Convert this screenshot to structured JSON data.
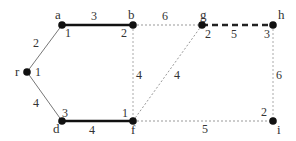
{
  "graph": {
    "nodes": [
      {
        "id": "r",
        "name": "r",
        "num": "1",
        "x": 27,
        "y": 72
      },
      {
        "id": "a",
        "name": "a",
        "num": "1",
        "x": 62,
        "y": 25
      },
      {
        "id": "b",
        "name": "b",
        "num": "2",
        "x": 133,
        "y": 25
      },
      {
        "id": "d",
        "name": "d",
        "num": "3",
        "x": 62,
        "y": 121
      },
      {
        "id": "f",
        "name": "f",
        "num": "1",
        "x": 133,
        "y": 121
      },
      {
        "id": "g",
        "name": "g",
        "num": "2",
        "x": 202,
        "y": 25
      },
      {
        "id": "h",
        "name": "h",
        "num": "3",
        "x": 273,
        "y": 25
      },
      {
        "id": "i",
        "name": "i",
        "num": "2",
        "x": 273,
        "y": 121
      }
    ],
    "edges": [
      {
        "from": "r",
        "to": "a",
        "weight": "2",
        "style": "thin-solid"
      },
      {
        "from": "r",
        "to": "d",
        "weight": "4",
        "style": "thin-solid"
      },
      {
        "from": "a",
        "to": "b",
        "weight": "3",
        "style": "thick-solid"
      },
      {
        "from": "d",
        "to": "f",
        "weight": "4",
        "style": "thick-solid"
      },
      {
        "from": "b",
        "to": "g",
        "weight": "6",
        "style": "dotted"
      },
      {
        "from": "b",
        "to": "f",
        "weight": "4",
        "style": "dotted"
      },
      {
        "from": "f",
        "to": "g",
        "weight": "4",
        "style": "dotted"
      },
      {
        "from": "g",
        "to": "h",
        "weight": "5",
        "style": "thick-dashed"
      },
      {
        "from": "h",
        "to": "i",
        "weight": "6",
        "style": "dotted"
      },
      {
        "from": "f",
        "to": "i",
        "weight": "5",
        "style": "dotted"
      }
    ]
  },
  "colors": {
    "node": "#111111",
    "thick_edge": "#111111",
    "thin_edge": "#777777",
    "dotted_edge": "#999999",
    "text": "#333333"
  }
}
